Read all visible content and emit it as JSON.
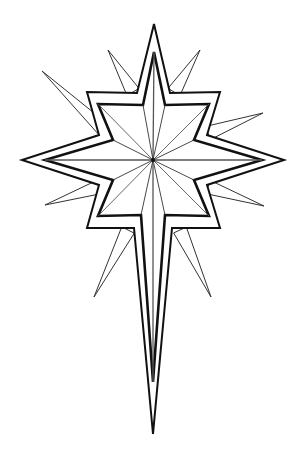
{
  "image": {
    "title": "Star of Bethlehem line drawing",
    "background": "#ffffff",
    "stroke_color": "#111111",
    "ray_color": "#333333"
  },
  "star": {
    "center": [
      153,
      160
    ],
    "outer_polygon": [
      [
        154,
        24
      ],
      [
        170,
        93
      ],
      [
        220,
        92
      ],
      [
        207,
        135
      ],
      [
        284,
        160
      ],
      [
        207,
        185
      ],
      [
        220,
        228
      ],
      [
        172,
        228
      ],
      [
        153,
        434
      ],
      [
        134,
        228
      ],
      [
        87,
        228
      ],
      [
        99,
        185
      ],
      [
        22,
        160
      ],
      [
        99,
        135
      ],
      [
        87,
        92
      ],
      [
        137,
        93
      ]
    ],
    "inner_polygon": [
      [
        154,
        52
      ],
      [
        165,
        105
      ],
      [
        209,
        104
      ],
      [
        194,
        140
      ],
      [
        262,
        160
      ],
      [
        194,
        180
      ],
      [
        209,
        216
      ],
      [
        165,
        215
      ],
      [
        153,
        382
      ],
      [
        141,
        215
      ],
      [
        98,
        216
      ],
      [
        113,
        180
      ],
      [
        45,
        160
      ],
      [
        113,
        140
      ],
      [
        98,
        104
      ],
      [
        143,
        105
      ]
    ],
    "spikes": [
      {
        "name": "upper-left",
        "points": [
          [
            104,
            130
          ],
          [
            42,
            71
          ]
        ]
      },
      {
        "name": "upper-left-2",
        "points": [
          [
            133,
            92
          ],
          [
            108,
            50
          ]
        ]
      },
      {
        "name": "upper-right",
        "points": [
          [
            174,
            92
          ],
          [
            200,
            50
          ]
        ]
      },
      {
        "name": "upper-right-2",
        "points": [
          [
            208,
            133
          ],
          [
            263,
            113
          ]
        ]
      },
      {
        "name": "lower-right",
        "points": [
          [
            208,
            187
          ],
          [
            264,
            206
          ]
        ]
      },
      {
        "name": "lower-right-2",
        "points": [
          [
            180,
            230
          ],
          [
            211,
            297
          ]
        ]
      },
      {
        "name": "lower-left",
        "points": [
          [
            128,
            230
          ],
          [
            94,
            297
          ]
        ]
      },
      {
        "name": "lower-left-2",
        "points": [
          [
            99,
            187
          ],
          [
            45,
            205
          ]
        ]
      }
    ]
  }
}
